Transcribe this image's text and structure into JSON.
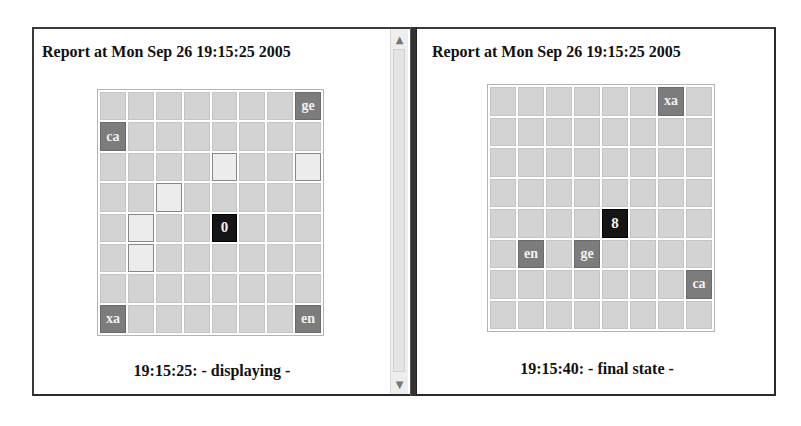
{
  "left_pane": {
    "title": "Report at Mon Sep 26 19:15:25 2005",
    "status": "19:15:25: - displaying -",
    "grid": {
      "rows": 8,
      "cols": 8,
      "cells": [
        [
          "",
          "",
          "",
          "",
          "",
          "",
          "",
          "ge"
        ],
        [
          "ca",
          "",
          "",
          "",
          "",
          "",
          "",
          ""
        ],
        [
          "",
          "",
          "",
          "",
          "#hl",
          "",
          "",
          "#hl"
        ],
        [
          "",
          "",
          "#hl",
          "",
          "",
          "",
          "",
          ""
        ],
        [
          "",
          "#hl",
          "",
          "",
          "0",
          "",
          "",
          ""
        ],
        [
          "",
          "#hl",
          "",
          "",
          "",
          "",
          "",
          ""
        ],
        [
          "",
          "",
          "",
          "",
          "",
          "",
          "",
          ""
        ],
        [
          "xa",
          "",
          "",
          "",
          "",
          "",
          "",
          "en"
        ]
      ],
      "agent_position": {
        "row": 4,
        "col": 4,
        "label": "0"
      }
    }
  },
  "right_pane": {
    "title": "Report at Mon Sep 26 19:15:25 2005",
    "status": "19:15:40: - final state -",
    "grid": {
      "rows": 8,
      "cols": 8,
      "cells": [
        [
          "",
          "",
          "",
          "",
          "",
          "",
          "xa",
          ""
        ],
        [
          "",
          "",
          "",
          "",
          "",
          "",
          "",
          ""
        ],
        [
          "",
          "",
          "",
          "",
          "",
          "",
          "",
          ""
        ],
        [
          "",
          "",
          "",
          "",
          "",
          "",
          "",
          ""
        ],
        [
          "",
          "",
          "",
          "",
          "8",
          "",
          "",
          ""
        ],
        [
          "",
          "en",
          "",
          "ge",
          "",
          "",
          "",
          ""
        ],
        [
          "",
          "",
          "",
          "",
          "",
          "",
          "",
          "ca"
        ],
        [
          "",
          "",
          "",
          "",
          "",
          "",
          "",
          ""
        ]
      ],
      "agent_position": {
        "row": 4,
        "col": 4,
        "label": "8"
      }
    }
  },
  "scrollbar": {
    "up_icon": "▲",
    "down_icon": "▼"
  },
  "colors": {
    "cell_empty": "#d3d3d3",
    "cell_tile": "#7c7c7c",
    "cell_highlight": "#ececec",
    "cell_agent": "#151515",
    "divider": "#333333"
  }
}
